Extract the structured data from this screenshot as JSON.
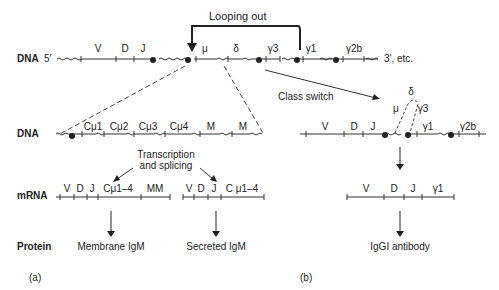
{
  "row_labels": {
    "dna_top": "DNA",
    "dna_mid": "DNA",
    "mrna": "mRNA",
    "protein": "Protein"
  },
  "top_dna": {
    "five_prime": "5′",
    "three_prime": "3′, etc.",
    "segments": [
      "V",
      "D",
      "J",
      "μ",
      "δ",
      "γ3",
      "γ1",
      "γ2b"
    ],
    "looping_label": "Looping out"
  },
  "panel_a": {
    "dna_segments": [
      "Cμ1",
      "Cμ2",
      "Cμ3",
      "Cμ4",
      "M",
      "M"
    ],
    "process_label_line1": "Transcription",
    "process_label_line2": "and splicing",
    "mrna_membrane": [
      "V",
      "D",
      "J",
      "Cμ1–4",
      "MM"
    ],
    "mrna_secreted": [
      "V",
      "D",
      "J",
      "C μ1–4"
    ],
    "protein_membrane": "Membrane IgM",
    "protein_secreted": "Secreted IgM",
    "panel_label": "(a)"
  },
  "panel_b": {
    "class_switch_label": "Class switch",
    "dna_segments": [
      "V",
      "D",
      "J",
      "γ1",
      "γ2b"
    ],
    "loop_segments": [
      "μ",
      "δ",
      "γ3"
    ],
    "mrna": [
      "V",
      "D",
      "J",
      "γ1"
    ],
    "protein": "IgGI antibody",
    "panel_label": "(b)"
  }
}
